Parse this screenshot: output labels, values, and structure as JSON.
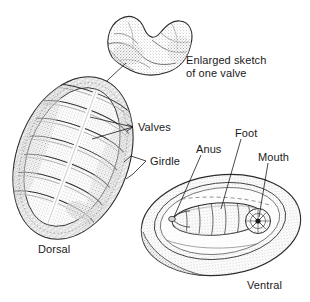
{
  "figure": {
    "view_count": 3,
    "ink_color": "#1a1a1a",
    "paper_color": "#ffffff",
    "stipple_color": "#8d8d8d"
  },
  "labels": {
    "enlarged_line1": "Enlarged sketch",
    "enlarged_line2": "of one valve",
    "valves": "Valves",
    "girdle": "Girdle",
    "anus": "Anus",
    "foot": "Foot",
    "mouth": "Mouth",
    "dorsal": "Dorsal",
    "ventral": "Ventral"
  },
  "parts": {
    "valve_sketch": "enlarged-valve-sketch",
    "dorsal_body": "dorsal-view-body",
    "ventral_body": "ventral-view-body",
    "valve_plate_count": 8,
    "foot": "ventral-foot",
    "mouth": "ventral-mouth",
    "anus": "ventral-anus",
    "girdle": "girdle-band"
  }
}
